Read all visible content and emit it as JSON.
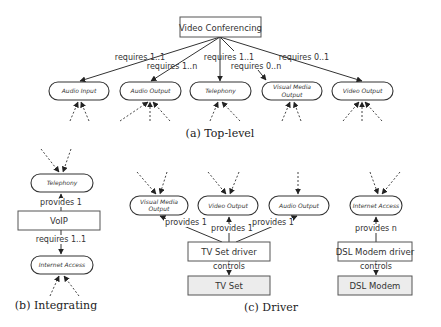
{
  "top_level": {
    "caption": "(a) Top-level",
    "root": "Video Conferencing",
    "children": [
      {
        "label": "Audio Input",
        "edge": "requires 1..1"
      },
      {
        "label": "Audio Output",
        "edge": "requires 1..n"
      },
      {
        "label": "Telephony",
        "edge": "requires 1..1"
      },
      {
        "label": "Visual Media Output",
        "label_line1": "Visual Media",
        "label_line2": "Output",
        "edge": "requires 0..n"
      },
      {
        "label": "Video Output",
        "edge": "requires 0..1"
      }
    ]
  },
  "integrating": {
    "caption": "(b) Integrating",
    "provided": "Telephony",
    "provides_label": "provides 1",
    "component": "VoIP",
    "requires_label": "requires 1..1",
    "required": "Internet Access"
  },
  "driver": {
    "caption": "(c) Driver",
    "tv": {
      "outputs": [
        {
          "label": "Visual Media Output",
          "label_line1": "Visual Media",
          "label_line2": "Output",
          "edge": "provides 1"
        },
        {
          "label": "Video Output",
          "edge": "provides 1"
        },
        {
          "label": "Audio Output",
          "edge": "provides 1"
        }
      ],
      "driver": "TV Set driver",
      "controls_label": "controls",
      "device": "TV Set"
    },
    "dsl": {
      "output": "Internet Access",
      "edge": "provides n",
      "driver": "DSL Modem driver",
      "controls_label": "controls",
      "device": "DSL Modem"
    }
  }
}
